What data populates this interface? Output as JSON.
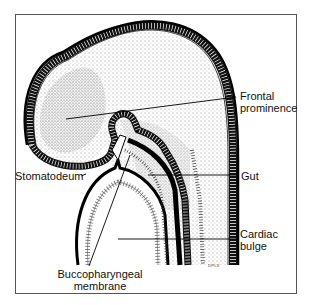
{
  "diagram": {
    "labels": {
      "frontal_prominence": [
        "Frontal",
        "prominence"
      ],
      "stomatodeum": "Stomatodeum",
      "gut": "Gut",
      "cardiac_bulge": [
        "Cardiac",
        "bulge"
      ],
      "buccopharyngeal_membrane": [
        "Buccopharyngeal",
        "membrane"
      ]
    },
    "signature": "DPLX"
  }
}
